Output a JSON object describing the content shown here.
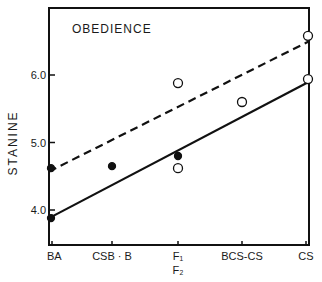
{
  "chart_data": {
    "type": "scatter",
    "title": "OBEDIENCE",
    "xlabel": "",
    "ylabel": "STANINE",
    "categories": [
      "BA",
      "CSB · B",
      "F1/F2",
      "BCS-CS",
      "CS"
    ],
    "category_labels": [
      {
        "line1": "BA",
        "line2": ""
      },
      {
        "line1": "CSB · B",
        "line2": ""
      },
      {
        "line1": "F₁",
        "line2": "F₂"
      },
      {
        "line1": "BCS-CS",
        "line2": ""
      },
      {
        "line1": "CS",
        "line2": ""
      }
    ],
    "yticks": [
      4.0,
      5.0,
      6.0
    ],
    "ytick_labels": [
      "4.0",
      "5.0",
      "6.0"
    ],
    "ylim": [
      3.5,
      7.0
    ],
    "grid": false,
    "series": [
      {
        "name": "filled points",
        "marker": "filled-circle",
        "points": [
          {
            "x": "BA",
            "y": 4.62
          },
          {
            "x": "BA",
            "y": 3.88
          },
          {
            "x": "CSB · B",
            "y": 4.65
          },
          {
            "x": "F1/F2",
            "y": 4.8
          }
        ]
      },
      {
        "name": "open points",
        "marker": "open-circle",
        "points": [
          {
            "x": "F1/F2",
            "y": 5.88
          },
          {
            "x": "F1/F2",
            "y": 4.62
          },
          {
            "x": "BCS-CS",
            "y": 5.6
          },
          {
            "x": "CS",
            "y": 6.58
          },
          {
            "x": "CS",
            "y": 5.94
          }
        ]
      }
    ],
    "lines": [
      {
        "name": "dashed regression",
        "style": "dashed",
        "start": {
          "x": "BA",
          "y": 4.57
        },
        "end": {
          "x": "CS",
          "y": 6.5
        }
      },
      {
        "name": "solid regression",
        "style": "solid",
        "start": {
          "x": "BA",
          "y": 3.88
        },
        "end": {
          "x": "CS",
          "y": 5.9
        }
      }
    ]
  }
}
